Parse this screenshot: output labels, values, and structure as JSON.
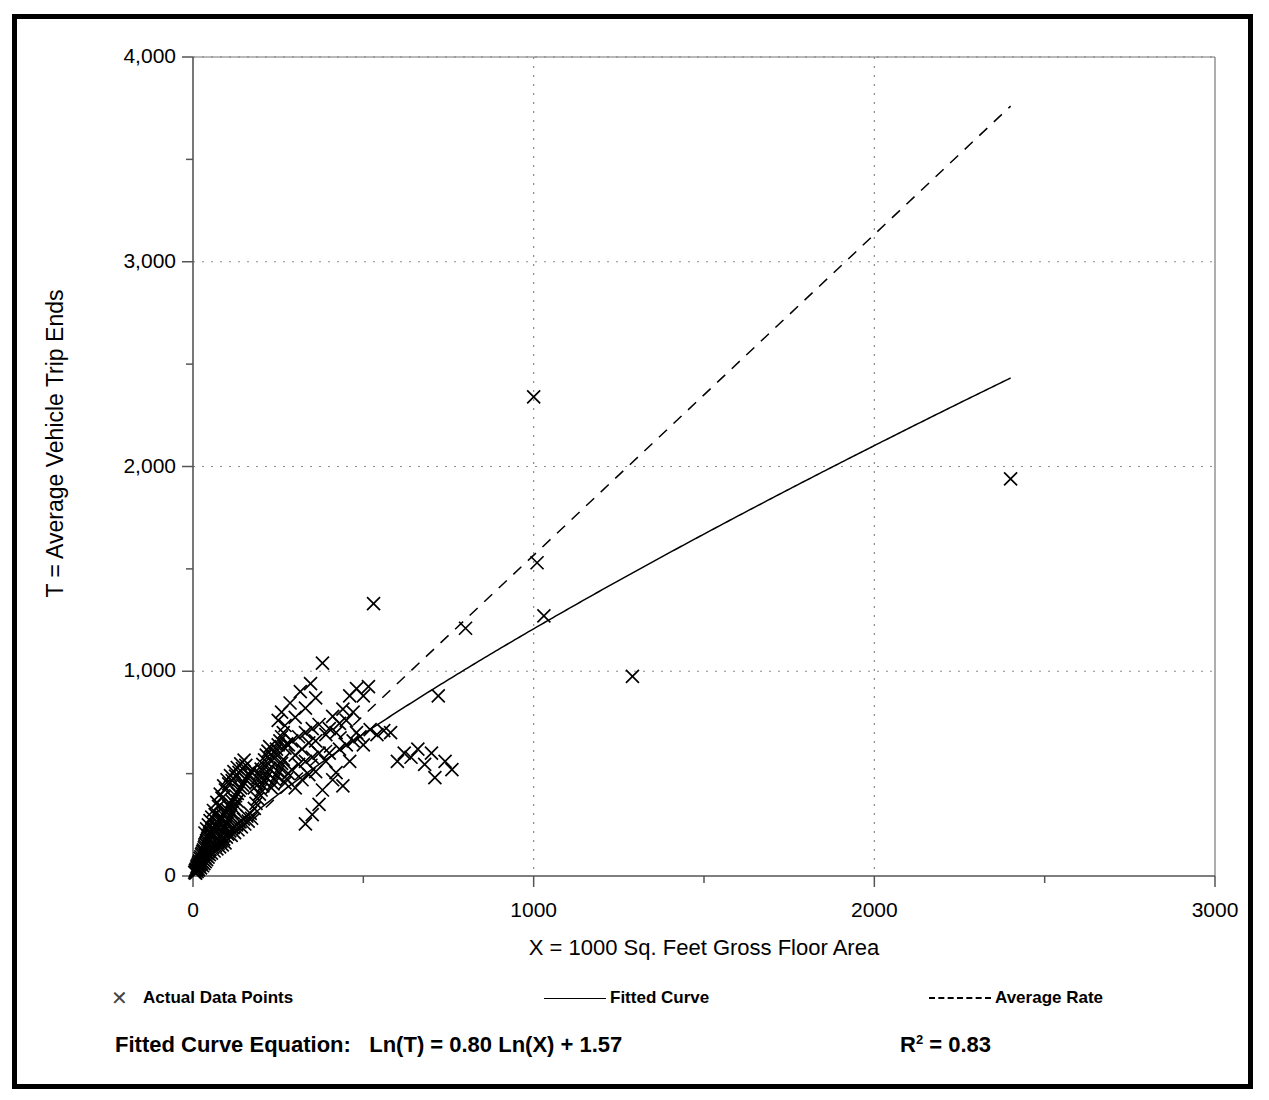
{
  "figure": {
    "border_color": "#000000",
    "background": "#ffffff"
  },
  "axis": {
    "ylabel": "T = Average Vehicle Trip Ends",
    "xlabel": "X = 1000 Sq. Feet Gross Floor Area",
    "yticks": [
      "0",
      "1,000",
      "2,000",
      "3,000",
      "4,000"
    ],
    "xticks": [
      "0",
      "1000",
      "2000",
      "3000"
    ]
  },
  "legend": {
    "items": [
      {
        "label": "Actual Data Points",
        "marker": "x-marker-icon"
      },
      {
        "label": "Fitted Curve",
        "marker": "solid-line-icon"
      },
      {
        "label": "Average Rate",
        "marker": "dashed-line-icon"
      }
    ]
  },
  "footer": {
    "equation_label": "Fitted Curve Equation:",
    "equation": "Ln(T) = 0.80 Ln(X) + 1.57",
    "r2_prefix": "R",
    "r2_exp": "2",
    "r2_value": " = 0.83"
  },
  "chart_data": {
    "type": "scatter",
    "title": "",
    "xlabel": "X = 1000 Sq. Feet Gross Floor Area",
    "ylabel": "T = Average Vehicle Trip Ends",
    "xlim": [
      0,
      3000
    ],
    "ylim": [
      0,
      4000
    ],
    "xticks": [
      0,
      1000,
      2000,
      3000
    ],
    "yticks": [
      0,
      1000,
      2000,
      3000,
      4000
    ],
    "xminor_step": 500,
    "yminor_step": 500,
    "grid": "dotted-major-gridlines",
    "legend_position": "below-plot",
    "series": [
      {
        "name": "Actual Data Points",
        "type": "scatter",
        "marker": "x",
        "color": "#000000",
        "points": [
          [
            5,
            18
          ],
          [
            7,
            26
          ],
          [
            8,
            14
          ],
          [
            9,
            34
          ],
          [
            10,
            28
          ],
          [
            11,
            44
          ],
          [
            12,
            22
          ],
          [
            13,
            50
          ],
          [
            14,
            36
          ],
          [
            15,
            58
          ],
          [
            16,
            30
          ],
          [
            17,
            66
          ],
          [
            18,
            46
          ],
          [
            19,
            74
          ],
          [
            20,
            54
          ],
          [
            21,
            86
          ],
          [
            22,
            40
          ],
          [
            23,
            94
          ],
          [
            24,
            62
          ],
          [
            25,
            104
          ],
          [
            26,
            70
          ],
          [
            27,
            112
          ],
          [
            28,
            50
          ],
          [
            29,
            120
          ],
          [
            30,
            80
          ],
          [
            31,
            128
          ],
          [
            32,
            60
          ],
          [
            33,
            138
          ],
          [
            34,
            90
          ],
          [
            35,
            146
          ],
          [
            36,
            70
          ],
          [
            37,
            156
          ],
          [
            38,
            100
          ],
          [
            39,
            164
          ],
          [
            40,
            80
          ],
          [
            41,
            172
          ],
          [
            42,
            110
          ],
          [
            43,
            182
          ],
          [
            44,
            92
          ],
          [
            45,
            190
          ],
          [
            46,
            120
          ],
          [
            47,
            200
          ],
          [
            48,
            104
          ],
          [
            49,
            208
          ],
          [
            50,
            130
          ],
          [
            52,
            216
          ],
          [
            54,
            112
          ],
          [
            56,
            226
          ],
          [
            58,
            140
          ],
          [
            60,
            234
          ],
          [
            62,
            122
          ],
          [
            64,
            244
          ],
          [
            66,
            150
          ],
          [
            68,
            252
          ],
          [
            70,
            132
          ],
          [
            72,
            262
          ],
          [
            74,
            160
          ],
          [
            76,
            270
          ],
          [
            78,
            142
          ],
          [
            80,
            280
          ],
          [
            82,
            170
          ],
          [
            84,
            288
          ],
          [
            86,
            152
          ],
          [
            88,
            298
          ],
          [
            90,
            180
          ],
          [
            92,
            306
          ],
          [
            94,
            162
          ],
          [
            96,
            316
          ],
          [
            98,
            190
          ],
          [
            100,
            324
          ],
          [
            102,
            205
          ],
          [
            105,
            340
          ],
          [
            108,
            220
          ],
          [
            110,
            352
          ],
          [
            112,
            198
          ],
          [
            115,
            366
          ],
          [
            118,
            236
          ],
          [
            120,
            378
          ],
          [
            122,
            212
          ],
          [
            125,
            392
          ],
          [
            128,
            250
          ],
          [
            130,
            404
          ],
          [
            132,
            226
          ],
          [
            135,
            418
          ],
          [
            138,
            264
          ],
          [
            140,
            430
          ],
          [
            142,
            240
          ],
          [
            145,
            444
          ],
          [
            148,
            278
          ],
          [
            150,
            456
          ],
          [
            152,
            254
          ],
          [
            155,
            470
          ],
          [
            158,
            292
          ],
          [
            160,
            482
          ],
          [
            162,
            268
          ],
          [
            165,
            496
          ],
          [
            168,
            306
          ],
          [
            170,
            508
          ],
          [
            172,
            282
          ],
          [
            175,
            522
          ],
          [
            60,
            320
          ],
          [
            65,
            300
          ],
          [
            70,
            360
          ],
          [
            75,
            340
          ],
          [
            80,
            400
          ],
          [
            85,
            380
          ],
          [
            90,
            440
          ],
          [
            95,
            420
          ],
          [
            100,
            470
          ],
          [
            105,
            450
          ],
          [
            110,
            490
          ],
          [
            115,
            466
          ],
          [
            120,
            510
          ],
          [
            125,
            488
          ],
          [
            130,
            530
          ],
          [
            135,
            506
          ],
          [
            140,
            548
          ],
          [
            145,
            524
          ],
          [
            150,
            566
          ],
          [
            155,
            540
          ],
          [
            35,
            210
          ],
          [
            40,
            230
          ],
          [
            45,
            250
          ],
          [
            50,
            270
          ],
          [
            55,
            288
          ],
          [
            60,
            198
          ],
          [
            65,
            218
          ],
          [
            70,
            238
          ],
          [
            75,
            258
          ],
          [
            80,
            276
          ],
          [
            85,
            196
          ],
          [
            90,
            216
          ],
          [
            95,
            236
          ],
          [
            100,
            256
          ],
          [
            105,
            274
          ],
          [
            110,
            294
          ],
          [
            115,
            312
          ],
          [
            120,
            330
          ],
          [
            125,
            348
          ],
          [
            130,
            366
          ],
          [
            180,
            430
          ],
          [
            185,
            455
          ],
          [
            190,
            478
          ],
          [
            195,
            500
          ],
          [
            200,
            522
          ],
          [
            205,
            545
          ],
          [
            210,
            567
          ],
          [
            215,
            590
          ],
          [
            220,
            610
          ],
          [
            225,
            632
          ],
          [
            180,
            330
          ],
          [
            185,
            355
          ],
          [
            190,
            378
          ],
          [
            195,
            400
          ],
          [
            200,
            420
          ],
          [
            205,
            440
          ],
          [
            210,
            462
          ],
          [
            215,
            482
          ],
          [
            220,
            504
          ],
          [
            225,
            524
          ],
          [
            230,
            560
          ],
          [
            235,
            580
          ],
          [
            240,
            600
          ],
          [
            245,
            620
          ],
          [
            250,
            640
          ],
          [
            255,
            660
          ],
          [
            260,
            680
          ],
          [
            265,
            700
          ],
          [
            270,
            625
          ],
          [
            275,
            645
          ],
          [
            230,
            430
          ],
          [
            235,
            450
          ],
          [
            240,
            470
          ],
          [
            245,
            490
          ],
          [
            250,
            510
          ],
          [
            255,
            530
          ],
          [
            260,
            550
          ],
          [
            265,
            570
          ],
          [
            270,
            455
          ],
          [
            275,
            475
          ],
          [
            280,
            640
          ],
          [
            290,
            660
          ],
          [
            300,
            590
          ],
          [
            310,
            680
          ],
          [
            320,
            620
          ],
          [
            330,
            700
          ],
          [
            340,
            650
          ],
          [
            350,
            720
          ],
          [
            360,
            660
          ],
          [
            370,
            740
          ],
          [
            280,
            500
          ],
          [
            290,
            520
          ],
          [
            300,
            430
          ],
          [
            310,
            545
          ],
          [
            320,
            470
          ],
          [
            330,
            560
          ],
          [
            340,
            495
          ],
          [
            350,
            580
          ],
          [
            360,
            510
          ],
          [
            370,
            600
          ],
          [
            250,
            760
          ],
          [
            260,
            800
          ],
          [
            270,
            735
          ],
          [
            285,
            845
          ],
          [
            300,
            775
          ],
          [
            315,
            900
          ],
          [
            330,
            820
          ],
          [
            345,
            940
          ],
          [
            360,
            870
          ],
          [
            380,
            1040
          ],
          [
            390,
            690
          ],
          [
            400,
            720
          ],
          [
            410,
            780
          ],
          [
            420,
            700
          ],
          [
            430,
            745
          ],
          [
            440,
            815
          ],
          [
            450,
            760
          ],
          [
            460,
            880
          ],
          [
            470,
            800
          ],
          [
            480,
            915
          ],
          [
            390,
            560
          ],
          [
            400,
            600
          ],
          [
            410,
            470
          ],
          [
            420,
            505
          ],
          [
            440,
            440
          ],
          [
            460,
            560
          ],
          [
            480,
            700
          ],
          [
            500,
            640
          ],
          [
            520,
            715
          ],
          [
            540,
            690
          ],
          [
            500,
            880
          ],
          [
            515,
            925
          ],
          [
            530,
            1330
          ],
          [
            560,
            710
          ],
          [
            580,
            700
          ],
          [
            600,
            560
          ],
          [
            620,
            600
          ],
          [
            640,
            580
          ],
          [
            660,
            620
          ],
          [
            680,
            545
          ],
          [
            700,
            600
          ],
          [
            710,
            480
          ],
          [
            720,
            880
          ],
          [
            740,
            560
          ],
          [
            760,
            520
          ],
          [
            800,
            1210
          ],
          [
            1000,
            2340
          ],
          [
            1010,
            1530
          ],
          [
            1030,
            1270
          ],
          [
            1290,
            975
          ],
          [
            2400,
            1940
          ],
          [
            330,
            255
          ],
          [
            350,
            300
          ],
          [
            370,
            350
          ],
          [
            380,
            420
          ],
          [
            430,
            620
          ],
          [
            450,
            640
          ],
          [
            470,
            660
          ],
          [
            490,
            680
          ]
        ]
      },
      {
        "name": "Fitted Curve",
        "type": "line",
        "style": "solid",
        "color": "#000000",
        "equation": "Ln(T) = 0.80 Ln(X) + 1.57",
        "r_squared": 0.83,
        "points": [
          [
            0,
            0
          ],
          [
            25,
            64
          ],
          [
            50,
            112
          ],
          [
            100,
            194
          ],
          [
            150,
            269
          ],
          [
            200,
            338
          ],
          [
            300,
            469
          ],
          [
            400,
            591
          ],
          [
            500,
            707
          ],
          [
            600,
            818
          ],
          [
            700,
            925
          ],
          [
            800,
            1029
          ],
          [
            900,
            1130
          ],
          [
            1000,
            1228
          ],
          [
            1200,
            1419
          ],
          [
            1400,
            1603
          ],
          [
            1600,
            1781
          ],
          [
            1800,
            1955
          ],
          [
            2000,
            2000
          ],
          [
            2200,
            2170
          ],
          [
            2400,
            2330
          ]
        ]
      },
      {
        "name": "Average Rate",
        "type": "line",
        "style": "dashed",
        "color": "#000000",
        "slope": 1.56,
        "points": [
          [
            0,
            0
          ],
          [
            2400,
            3760
          ]
        ]
      }
    ]
  }
}
